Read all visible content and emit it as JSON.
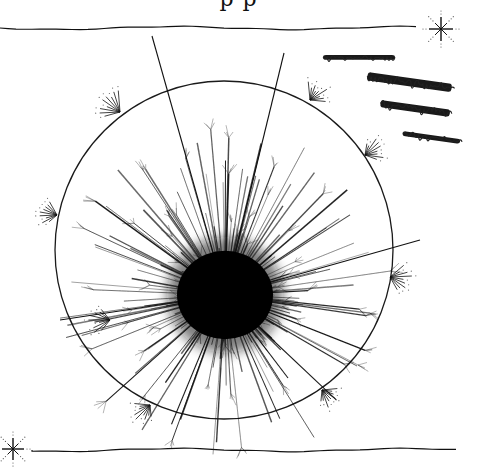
{
  "canvas": {
    "width": 477,
    "height": 469,
    "background": "#ffffff",
    "ink": "#111111"
  },
  "header": {
    "cut_off_text": "p p"
  },
  "rules": [
    {
      "name": "top-wavy-rule",
      "x1": 0,
      "x2": 418,
      "y": 28,
      "amplitude": 1.5
    },
    {
      "name": "bottom-wavy-rule",
      "x1": 32,
      "x2": 462,
      "y": 450,
      "amplitude": 1.5
    }
  ],
  "stars": [
    {
      "name": "top-right-sparkle",
      "cx": 441,
      "cy": 29,
      "r": 12,
      "dot_r": 20
    },
    {
      "name": "bottom-left-sparkle",
      "cx": 13,
      "cy": 449,
      "r": 11,
      "dot_r": 18
    }
  ],
  "circle": {
    "cx": 224,
    "cy": 250,
    "r": 169,
    "stroke": "#1a1a1a",
    "stroke_width": 1.3
  },
  "burst": {
    "cx": 225,
    "cy": 295,
    "core_r": 48,
    "ray_count": 180,
    "min_len": 40,
    "max_len": 170,
    "seed": 7
  },
  "long_rays": [
    {
      "x1": 225,
      "y1": 295,
      "x2": 152,
      "y2": 36
    },
    {
      "x1": 225,
      "y1": 295,
      "x2": 284,
      "y2": 53
    },
    {
      "x1": 225,
      "y1": 295,
      "x2": 420,
      "y2": 240
    },
    {
      "x1": 225,
      "y1": 295,
      "x2": 60,
      "y2": 320
    }
  ],
  "rim_sparkles": [
    {
      "cx": 120,
      "cy": 112,
      "angle": 215
    },
    {
      "cx": 310,
      "cy": 100,
      "angle": 315
    },
    {
      "cx": 365,
      "cy": 155,
      "angle": 330
    },
    {
      "cx": 57,
      "cy": 215,
      "angle": 190
    },
    {
      "cx": 390,
      "cy": 277,
      "angle": 10
    },
    {
      "cx": 110,
      "cy": 320,
      "angle": 180
    },
    {
      "cx": 150,
      "cy": 405,
      "angle": 135
    },
    {
      "cx": 322,
      "cy": 390,
      "angle": 45
    }
  ],
  "scribbles": [
    {
      "name": "scribble-1",
      "x": 323,
      "y": 55,
      "w": 72,
      "h": 8
    },
    {
      "name": "scribble-2",
      "x": 368,
      "y": 72,
      "w": 85,
      "h": 14
    },
    {
      "name": "scribble-3",
      "x": 381,
      "y": 100,
      "w": 70,
      "h": 12
    },
    {
      "name": "scribble-4",
      "x": 403,
      "y": 131,
      "w": 58,
      "h": 8
    }
  ]
}
